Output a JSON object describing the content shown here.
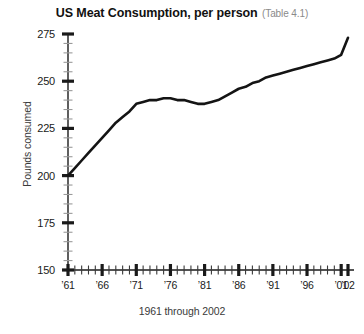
{
  "chart_data": {
    "type": "line",
    "title": "US Meat Consumption, per person",
    "title_note": "(Table 4.1)",
    "xlabel": "1961 through 2002",
    "ylabel": "Pounds consumed",
    "ylim": [
      150,
      275
    ],
    "y_major_step": 25,
    "y_minor_step": 5,
    "y_ticks": [
      150,
      175,
      200,
      225,
      250,
      275
    ],
    "y_tick_labels": [
      "150",
      "175",
      "200",
      "225",
      "250",
      "275"
    ],
    "xlim": [
      1961,
      2002
    ],
    "x_major_step": 5,
    "x_minor_step": 1,
    "x_ticks": [
      1961,
      1966,
      1971,
      1976,
      1981,
      1986,
      1991,
      1996,
      2001,
      2002
    ],
    "x_tick_labels": [
      "’61",
      "’66",
      "’71",
      "’76",
      "’81",
      "’86",
      "’91",
      "’96",
      "’01",
      "’02"
    ],
    "grid": false,
    "legend": "none",
    "line_color": "#141414",
    "axis_color": "#1a1a1a",
    "x": [
      1961,
      1962,
      1963,
      1964,
      1965,
      1966,
      1967,
      1968,
      1969,
      1970,
      1971,
      1972,
      1973,
      1974,
      1975,
      1976,
      1977,
      1978,
      1979,
      1980,
      1981,
      1982,
      1983,
      1984,
      1985,
      1986,
      1987,
      1988,
      1989,
      1990,
      1991,
      1992,
      1993,
      1994,
      1995,
      1996,
      1997,
      1998,
      1999,
      2000,
      2001,
      2002
    ],
    "values": [
      200,
      204,
      208,
      212,
      216,
      220,
      224,
      228,
      231,
      234,
      238,
      239,
      240,
      240,
      241,
      241,
      240,
      240,
      239,
      238,
      238,
      239,
      240,
      242,
      244,
      246,
      247,
      249,
      250,
      252,
      253,
      254,
      255,
      256,
      257,
      258,
      259,
      260,
      261,
      262,
      264,
      273
    ],
    "series": [
      {
        "name": "US meat consumption per person",
        "values": [
          200,
          204,
          208,
          212,
          216,
          220,
          224,
          228,
          231,
          234,
          238,
          239,
          240,
          240,
          241,
          241,
          240,
          240,
          239,
          238,
          238,
          239,
          240,
          242,
          244,
          246,
          247,
          249,
          250,
          252,
          253,
          254,
          255,
          256,
          257,
          258,
          259,
          260,
          261,
          262,
          264,
          273
        ]
      }
    ],
    "annotations": [
      "Starts near 200 pounds in 1961",
      "Steep rise through the 1960s to about 238 by 1971",
      "Plateau near 238-241 from 1971 to 1981",
      "Steady climb from 1981 to about 262 by 2000",
      "Sharp final uptick to about 273 in 2002"
    ]
  }
}
